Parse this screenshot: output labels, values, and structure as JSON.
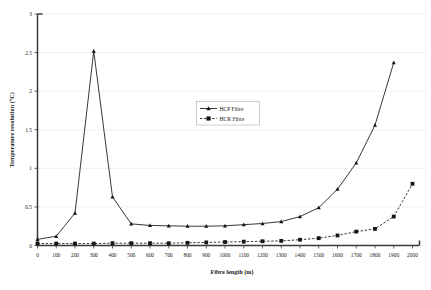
{
  "chart_data": {
    "type": "line",
    "title": "",
    "xlabel": "Fibre length (m)",
    "ylabel": "Temperature resolution (°C)",
    "xlim": [
      0,
      2000
    ],
    "ylim": [
      0,
      3
    ],
    "xticks": [
      0,
      100,
      200,
      300,
      400,
      500,
      600,
      700,
      800,
      900,
      1000,
      1100,
      1200,
      1300,
      1400,
      1500,
      1600,
      1700,
      1800,
      1900,
      2000
    ],
    "xticklabels": [
      "0",
      "100",
      "200",
      "300",
      "400",
      "500",
      "600",
      "700",
      "800",
      "900",
      "1000",
      "1100",
      "1200",
      "1300",
      "1400",
      "1500",
      "1600",
      "1700",
      "1800",
      "1900",
      "2000"
    ],
    "yticks": [
      0,
      0.5,
      1,
      1.5,
      2,
      2.5,
      3
    ],
    "yticklabels": [
      "0",
      "0.5",
      "1",
      "1.5",
      "2",
      "2.5",
      "3"
    ],
    "grid": true,
    "grid_axis": "y",
    "legend_position": "upper-center",
    "x": [
      0,
      100,
      200,
      300,
      400,
      500,
      600,
      700,
      800,
      900,
      1000,
      1100,
      1200,
      1300,
      1400,
      1500,
      1600,
      1700,
      1800,
      1900,
      2000
    ],
    "series": [
      {
        "name": "HCP Fibre",
        "marker": "triangle",
        "linestyle": "solid",
        "color": "#141414",
        "values": [
          0.08,
          0.12,
          0.42,
          2.52,
          0.63,
          0.28,
          0.26,
          0.255,
          0.25,
          0.25,
          0.255,
          0.27,
          0.285,
          0.31,
          0.375,
          0.49,
          0.73,
          1.07,
          1.56,
          2.37,
          null
        ]
      },
      {
        "name": "HCR Fibre",
        "marker": "square",
        "linestyle": "dashed",
        "color": "#141414",
        "values": [
          0.025,
          0.025,
          0.025,
          0.025,
          0.03,
          0.03,
          0.03,
          0.03,
          0.035,
          0.04,
          0.045,
          0.05,
          0.055,
          0.06,
          0.075,
          0.095,
          0.13,
          0.18,
          0.215,
          0.375,
          0.8
        ]
      }
    ]
  },
  "legend": {
    "items": [
      {
        "label": "HCP Fibre"
      },
      {
        "label": "HCR Fibre"
      }
    ]
  }
}
